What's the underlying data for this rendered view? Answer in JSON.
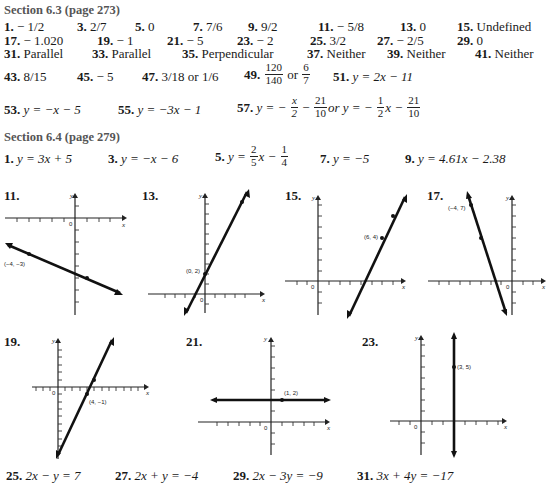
{
  "section_63": {
    "heading": "Section 6.3 (page 273)",
    "answers": [
      {
        "n": "1.",
        "v": "− 1/2"
      },
      {
        "n": "3.",
        "v": "2/7"
      },
      {
        "n": "5.",
        "v": "0"
      },
      {
        "n": "7.",
        "v": "7/6"
      },
      {
        "n": "9.",
        "v": "9/2"
      },
      {
        "n": "11.",
        "v": "− 5/8"
      },
      {
        "n": "13.",
        "v": "0"
      },
      {
        "n": "15.",
        "v": "Undefined"
      },
      {
        "n": "17.",
        "v": "− 1.020"
      },
      {
        "n": "19.",
        "v": "− 1"
      },
      {
        "n": "21.",
        "v": "− 5"
      },
      {
        "n": "23.",
        "v": "− 2"
      },
      {
        "n": "25.",
        "v": "3/2"
      },
      {
        "n": "27.",
        "v": "− 2/5"
      },
      {
        "n": "29.",
        "v": "0"
      },
      {
        "n": "31.",
        "v": "Parallel"
      },
      {
        "n": "33.",
        "v": "Parallel"
      },
      {
        "n": "35.",
        "v": "Perpendicular"
      },
      {
        "n": "37.",
        "v": "Neither"
      },
      {
        "n": "39.",
        "v": "Neither"
      },
      {
        "n": "41.",
        "v": "Neither"
      },
      {
        "n": "43.",
        "v": "8/15"
      },
      {
        "n": "45.",
        "v": "− 5"
      },
      {
        "n": "47.",
        "v": "3/18 or 1/6"
      },
      {
        "n": "49.",
        "num1": "120",
        "den1": "140",
        "or": "or",
        "num2": "6",
        "den2": "7"
      },
      {
        "n": "51.",
        "v": "y = 2x − 11"
      },
      {
        "n": "53.",
        "v": "y = −x − 5"
      },
      {
        "n": "55.",
        "v": "y = −3x − 1"
      },
      {
        "n": "57.",
        "pre": "y = −",
        "f1n": "x",
        "f1d": "2",
        "mid": "−",
        "f2n": "21",
        "f2d": "10",
        "or": "or y = −",
        "f3n": "1",
        "f3d": "2",
        "post": "x −",
        "f4n": "21",
        "f4d": "10"
      }
    ]
  },
  "section_64": {
    "heading": "Section 6.4 (page 279)",
    "answers": [
      {
        "n": "1.",
        "v": "y = 3x + 5"
      },
      {
        "n": "3.",
        "v": "y = −x − 6"
      },
      {
        "n": "5.",
        "pre": "y =",
        "fn": "2",
        "fd": "5",
        "mid": "x −",
        "gn": "1",
        "gd": "4"
      },
      {
        "n": "7.",
        "v": "y = −5"
      },
      {
        "n": "9.",
        "v": "y = 4.61x − 2.38"
      }
    ],
    "graphs": [
      {
        "n": "11.",
        "point_label": "(−4, −3)"
      },
      {
        "n": "13.",
        "point_label": "(0, 2)"
      },
      {
        "n": "15.",
        "point_label": "(6, 4)"
      },
      {
        "n": "17.",
        "point_label": "(−4, 7)"
      },
      {
        "n": "19.",
        "point_label": "(4, −1)"
      },
      {
        "n": "21.",
        "point_label": "(1, 2)"
      },
      {
        "n": "23.",
        "point_label": "(3, 5)"
      }
    ],
    "axis": {
      "x": "x",
      "y": "y",
      "origin": "0"
    },
    "bottom": [
      {
        "n": "25.",
        "v": "2x − y = 7"
      },
      {
        "n": "27.",
        "v": "2x + y = −4"
      },
      {
        "n": "29.",
        "v": "2x − 3y = −9"
      },
      {
        "n": "31.",
        "v": "3x + 4y = −17"
      }
    ]
  }
}
